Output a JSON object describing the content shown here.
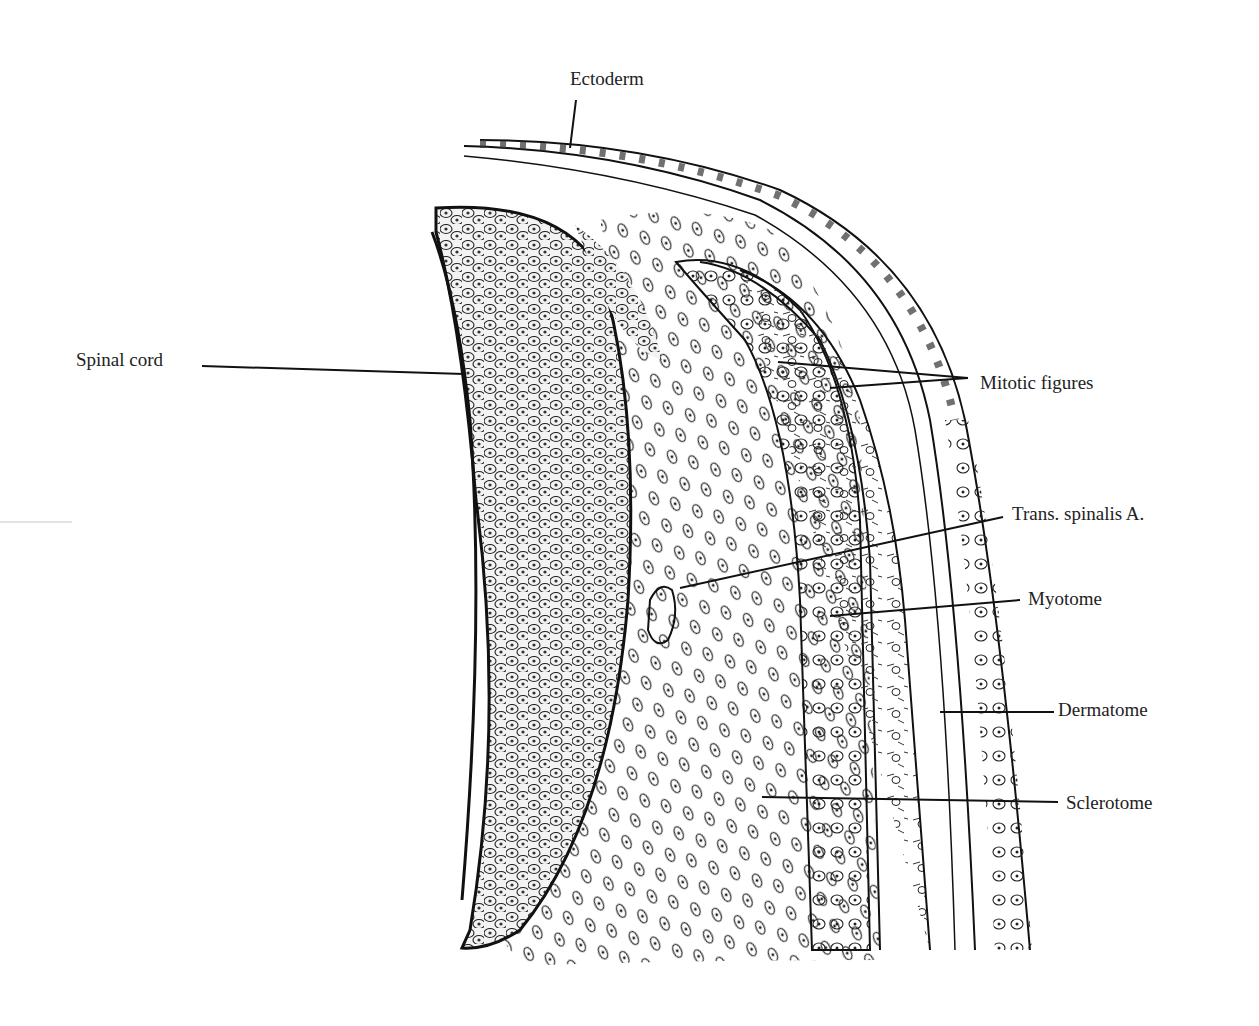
{
  "figure": {
    "background": "#ffffff",
    "ink_color": "#1a1a1a",
    "labels": {
      "ectoderm": "Ectoderm",
      "spinal_cord": "Spinal cord",
      "mitotic_figures": "Mitotic figures",
      "trans_spinalis": "Trans. spinalis A.",
      "myotome": "Myotome",
      "dermatome": "Dermatome",
      "sclerotome": "Sclerotome"
    }
  }
}
